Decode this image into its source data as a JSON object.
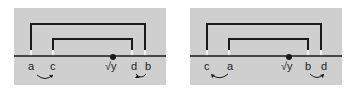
{
  "colors": {
    "panel_bg": "#cfcfcf",
    "line": "#1a1a1a",
    "tick": "#f2f2f2"
  },
  "panels": [
    {
      "labels": {
        "a": "a",
        "c": "c",
        "y": "√y",
        "d": "d",
        "b": "b"
      },
      "order": [
        "a",
        "c",
        "√y",
        "d",
        "b"
      ]
    },
    {
      "labels": {
        "c": "c",
        "a": "a",
        "y": "√y",
        "b": "b",
        "d": "d"
      },
      "order": [
        "c",
        "a",
        "√y",
        "b",
        "d"
      ]
    }
  ]
}
